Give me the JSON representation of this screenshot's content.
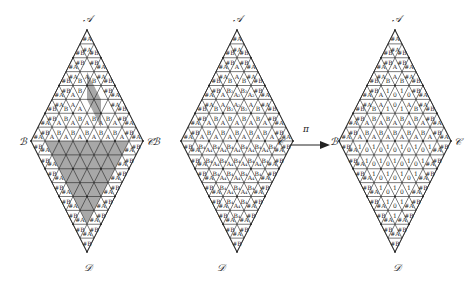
{
  "figure": {
    "arrow_label": "π",
    "diamonds": [
      {
        "id": "left",
        "vertices": {
          "top": "𝒜",
          "left": "ℬ",
          "right": "𝒞",
          "bottom": "𝒟"
        },
        "shaded": true,
        "upper_rows": [
          {
            "ups": [
              "#A"
            ],
            "downs": []
          },
          {
            "ups": [
              "#B",
              "#B"
            ],
            "downs": [
              "#A"
            ]
          },
          {
            "ups": [
              "#A",
              "",
              "#A"
            ],
            "downs": [
              "#B",
              "#B"
            ]
          },
          {
            "ups": [
              "#B",
              "B",
              "B",
              "#B"
            ],
            "downs": [
              "#A",
              "A",
              "#A"
            ]
          },
          {
            "ups": [
              "#A",
              "A",
              "",
              "",
              "#A"
            ],
            "downs": [
              "#B",
              "B",
              "",
              "#B"
            ]
          },
          {
            "ups": [
              "#B",
              "B",
              "A",
              "",
              "",
              "#B"
            ],
            "downs": [
              "#A",
              "A",
              "",
              "",
              "#A"
            ]
          },
          {
            "ups": [
              "#A",
              "A",
              "A",
              "A",
              "A",
              "A",
              "#A"
            ],
            "downs": [
              "#B",
              "B",
              "B",
              "B",
              "B",
              "#B"
            ]
          },
          {
            "ups": [
              "#A",
              "A",
              "A",
              "A",
              "A",
              "A",
              "A",
              "#A"
            ],
            "downs": [
              "#B",
              "B",
              "B",
              "B",
              "B",
              "B",
              "#B"
            ]
          }
        ],
        "lower_rows": [
          {
            "downs": [
              "#B",
              "",
              "",
              "",
              "",
              "",
              "",
              "#B"
            ],
            "ups": [
              "#A",
              "",
              "",
              "",
              "",
              "",
              "#A"
            ]
          },
          {
            "downs": [
              "#B",
              "",
              "",
              "",
              "",
              "",
              "#B"
            ],
            "ups": [
              "#A",
              "",
              "",
              "",
              "",
              "#A"
            ]
          },
          {
            "downs": [
              "#B",
              "",
              "",
              "",
              "",
              "#B"
            ],
            "ups": [
              "#A",
              "",
              "",
              "",
              "#A"
            ]
          },
          {
            "downs": [
              "#B",
              "",
              "",
              "",
              "#B"
            ],
            "ups": [
              "#A",
              "",
              "",
              "#A"
            ]
          },
          {
            "downs": [
              "#B",
              "",
              "",
              "#B"
            ],
            "ups": [
              "#A",
              "",
              "#A"
            ]
          },
          {
            "downs": [
              "#B",
              "",
              "#B"
            ],
            "ups": [
              "#A",
              "#A"
            ]
          },
          {
            "downs": [
              "#B",
              "#B"
            ],
            "ups": [
              "#A"
            ]
          },
          {
            "downs": [
              "#B"
            ],
            "ups": []
          }
        ]
      },
      {
        "id": "middle",
        "vertices": {
          "top": "𝒜",
          "left": "ℬ",
          "right": "𝒞",
          "bottom": "𝒟"
        },
        "shaded": false,
        "upper_rows": [
          {
            "ups": [
              "#A"
            ],
            "downs": []
          },
          {
            "ups": [
              "#B",
              "#B"
            ],
            "downs": [
              "#A"
            ]
          },
          {
            "ups": [
              "#A",
              "A",
              "#A"
            ],
            "downs": [
              "#B",
              "#B"
            ]
          },
          {
            "ups": [
              "#B",
              "B",
              "B",
              "#B"
            ],
            "downs": [
              "#A",
              "A",
              "#A"
            ]
          },
          {
            "ups": [
              "#A",
              "A",
              "A₂",
              "A₂",
              "#A"
            ],
            "downs": [
              "#B",
              "B₂",
              "B₂",
              "#B"
            ]
          },
          {
            "ups": [
              "#B",
              "B",
              "B₂",
              "B₂",
              "B",
              "#B"
            ],
            "downs": [
              "#A",
              "A",
              "A₂",
              "A",
              "#A"
            ]
          },
          {
            "ups": [
              "#A",
              "A",
              "A",
              "A",
              "A",
              "A",
              "#A"
            ],
            "downs": [
              "#B",
              "B",
              "B",
              "B",
              "B",
              "#B"
            ]
          },
          {
            "ups": [
              "#A",
              "A",
              "A",
              "A",
              "A",
              "A",
              "A",
              "#A"
            ],
            "downs": [
              "#B",
              "B",
              "B",
              "B",
              "B",
              "B",
              "#B"
            ]
          }
        ],
        "lower_rows": [
          {
            "downs": [
              "#B",
              "B₄",
              "B₄",
              "B₄",
              "B₄",
              "B₄",
              "B₄",
              "#B"
            ],
            "ups": [
              "#A",
              "A₄",
              "A₄",
              "A₄",
              "A₄",
              "A₄",
              "#A"
            ]
          },
          {
            "downs": [
              "#B",
              "B₄",
              "B₄",
              "B₄",
              "B₄",
              "B₄",
              "#B"
            ],
            "ups": [
              "#A",
              "A₄",
              "A₄",
              "A₄",
              "A₄",
              "#A"
            ]
          },
          {
            "downs": [
              "#B",
              "B₄",
              "B₄",
              "B₄",
              "B₄",
              "#B"
            ],
            "ups": [
              "#A",
              "A₄",
              "A₄",
              "A₄",
              "#A"
            ]
          },
          {
            "downs": [
              "#B",
              "B₄",
              "B₄",
              "B₄",
              "#B"
            ],
            "ups": [
              "#A",
              "A₄",
              "A₄",
              "#A"
            ]
          },
          {
            "downs": [
              "#B",
              "B₄",
              "B₄",
              "#B"
            ],
            "ups": [
              "#A",
              "A₄",
              "#A"
            ]
          },
          {
            "downs": [
              "#B",
              "B₄",
              "#B"
            ],
            "ups": [
              "#A",
              "#A"
            ]
          },
          {
            "downs": [
              "#B",
              "#B"
            ],
            "ups": [
              "#A"
            ]
          },
          {
            "downs": [
              "#B"
            ],
            "ups": []
          }
        ]
      },
      {
        "id": "right",
        "vertices": {
          "top": "𝒜",
          "left": "ℬ",
          "right": "𝒞",
          "bottom": "𝒟"
        },
        "shaded": false,
        "upper_rows": [
          {
            "ups": [
              "#A"
            ],
            "downs": []
          },
          {
            "ups": [
              "#B",
              "#B"
            ],
            "downs": [
              "#A"
            ]
          },
          {
            "ups": [
              "#A",
              "A",
              "#A"
            ],
            "downs": [
              "#B",
              "#B"
            ]
          },
          {
            "ups": [
              "#B",
              "B",
              "B",
              "#B"
            ],
            "downs": [
              "#A",
              "A",
              "#A"
            ]
          },
          {
            "ups": [
              "#A",
              "A",
              "0",
              "0",
              "#A"
            ],
            "downs": [
              "#B",
              "1",
              "1",
              "#B"
            ]
          },
          {
            "ups": [
              "#B",
              "B",
              "1",
              "1",
              "B",
              "#B"
            ],
            "downs": [
              "#A",
              "A",
              "0",
              "A",
              "#A"
            ]
          },
          {
            "ups": [
              "#A",
              "A",
              "A",
              "A",
              "A",
              "A",
              "#A"
            ],
            "downs": [
              "#B",
              "B",
              "B",
              "B",
              "B",
              "#B"
            ]
          },
          {
            "ups": [
              "#A",
              "A",
              "A",
              "A",
              "A",
              "A",
              "A",
              "#A"
            ],
            "downs": [
              "#B",
              "B",
              "B",
              "B",
              "B",
              "B",
              "#B"
            ]
          }
        ],
        "lower_rows": [
          {
            "downs": [
              "#B",
              "1",
              "1",
              "1",
              "1",
              "1",
              "1",
              "#B"
            ],
            "ups": [
              "#A",
              "0",
              "0",
              "0",
              "0",
              "0",
              "#A"
            ]
          },
          {
            "downs": [
              "#B",
              "1",
              "1",
              "1",
              "1",
              "1",
              "#B"
            ],
            "ups": [
              "#A",
              "0",
              "0",
              "0",
              "0",
              "#A"
            ]
          },
          {
            "downs": [
              "#B",
              "1",
              "1",
              "1",
              "1",
              "#B"
            ],
            "ups": [
              "#A",
              "0",
              "0",
              "0",
              "#A"
            ]
          },
          {
            "downs": [
              "#B",
              "1",
              "1",
              "1",
              "#B"
            ],
            "ups": [
              "#A",
              "0",
              "0",
              "#A"
            ]
          },
          {
            "downs": [
              "#B",
              "1",
              "1",
              "#B"
            ],
            "ups": [
              "#A",
              "0",
              "#A"
            ]
          },
          {
            "downs": [
              "#B",
              "1",
              "#B"
            ],
            "ups": [
              "#A",
              "#A"
            ]
          },
          {
            "downs": [
              "#B",
              "#B"
            ],
            "ups": [
              "#A"
            ]
          },
          {
            "downs": [
              "#B"
            ],
            "ups": []
          }
        ]
      }
    ]
  },
  "colors": {
    "line": "#222222",
    "shade": "#a8a8a8",
    "background": "#ffffff"
  }
}
